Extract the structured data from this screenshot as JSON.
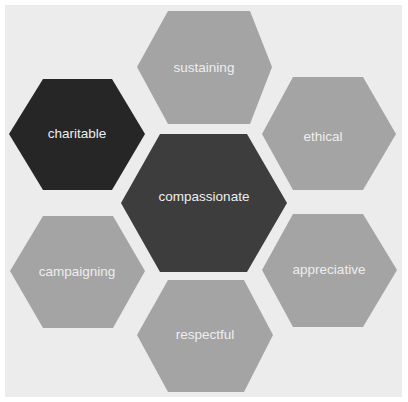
{
  "diagram": {
    "type": "hexagon-cluster",
    "background_color": "#ececec",
    "center": {
      "label": "compassionate",
      "color": "#3d3d3d",
      "points": "160,134 247,134 287,203 247,272 160,272 121,203",
      "label_x": 204,
      "label_y": 197
    },
    "hexagons": [
      {
        "label": "sustaining",
        "color": "#a4a4a4",
        "points": "168,11 250,11 272,67 250,124 168,124 137,67",
        "label_x": 204,
        "label_y": 68
      },
      {
        "label": "ethical",
        "color": "#a4a4a4",
        "points": "293,77 363,77 396,134 363,190 293,190 262,134",
        "label_x": 323,
        "label_y": 137
      },
      {
        "label": "appreciative",
        "color": "#a4a4a4",
        "points": "293,214 363,214 397,270 363,327 293,327 262,270",
        "label_x": 329,
        "label_y": 270
      },
      {
        "label": "respectful",
        "color": "#a4a4a4",
        "points": "168,280 244,280 273,335 244,392 168,392 137,335",
        "label_x": 205,
        "label_y": 335
      },
      {
        "label": "campaigning",
        "color": "#a4a4a4",
        "points": "43,216 113,216 145,271 113,328 43,328 10,271",
        "label_x": 77,
        "label_y": 272
      },
      {
        "label": "charitable",
        "color": "#262626",
        "points": "43,79 112,79 145,134 112,190 43,190 9,134",
        "label_x": 77,
        "label_y": 134
      }
    ]
  }
}
